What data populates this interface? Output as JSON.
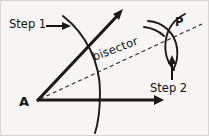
{
  "figure": {
    "type": "geometric-construction",
    "background_color": "#f6f5f3",
    "ink_color": "#1a1a1a",
    "width": 209,
    "height": 136,
    "labels": {
      "step1": "Step 1",
      "step2": "Step 2",
      "vertex": "A",
      "point": "P",
      "bisector": "bisector"
    },
    "geometry": {
      "vertex_a": [
        38,
        100
      ],
      "upper_ray_end": [
        122,
        11
      ],
      "horizontal_ray_end": [
        162,
        100
      ],
      "point_p": [
        172,
        31
      ],
      "bisector_start": [
        40,
        99
      ],
      "bisector_end": [
        200,
        25
      ],
      "step1_arc_label_target": [
        74,
        30
      ],
      "step2_arrow_from": [
        172,
        80
      ],
      "step2_arrow_to": [
        172,
        57
      ]
    }
  }
}
